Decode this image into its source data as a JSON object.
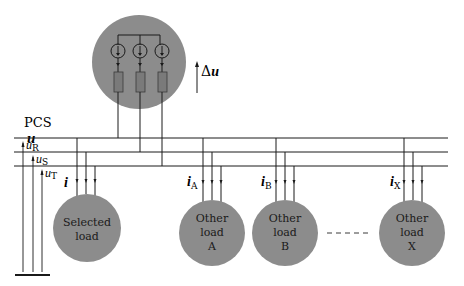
{
  "pcs": {
    "label": "PCS",
    "voltage_symbol": "u",
    "delta_symbol": "Δ",
    "delta_u": "u"
  },
  "phases": [
    {
      "name": "u",
      "sub": "R"
    },
    {
      "name": "u",
      "sub": "S"
    },
    {
      "name": "u",
      "sub": "T"
    }
  ],
  "loads": [
    {
      "id": "selected",
      "lines": [
        "Selected",
        "load"
      ],
      "current": "i",
      "current_sub": ""
    },
    {
      "id": "A",
      "lines": [
        "Other",
        "load",
        "A"
      ],
      "current": "i",
      "current_sub": "A"
    },
    {
      "id": "B",
      "lines": [
        "Other",
        "load",
        "B"
      ],
      "current": "i",
      "current_sub": "B"
    },
    {
      "id": "X",
      "lines": [
        "Other",
        "load",
        "X"
      ],
      "current": "i",
      "current_sub": "X"
    }
  ],
  "colors": {
    "circle_fill": "#8c8c8c",
    "resistor_fill": "#7a7a7a",
    "line": "#1a1a1a"
  }
}
